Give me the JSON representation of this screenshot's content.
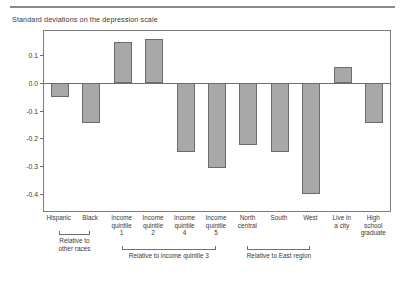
{
  "chart_data": {
    "type": "bar",
    "title": "Standard deviations on the depression scale",
    "xlabel": "",
    "ylabel": "",
    "ylim": [
      -0.46,
      0.185
    ],
    "grid": false,
    "legend": null,
    "yticks": [
      0.1,
      0.0,
      -0.1,
      -0.2,
      -0.3,
      -0.4
    ],
    "ytick_labels": [
      "0.1",
      "0.0",
      "-0.1",
      "-0.2",
      "-0.3",
      "-0.4"
    ],
    "categories": [
      "Hispanic",
      "Black",
      "Income quintile 1",
      "Income quintile 2",
      "Income quintile 4",
      "Income quintile 5",
      "North central",
      "South",
      "West",
      "Live in a city",
      "High school graduate"
    ],
    "category_lines": [
      [
        "Hispanic"
      ],
      [
        "Black"
      ],
      [
        "Income",
        "quintile",
        "1"
      ],
      [
        "Income",
        "quintile",
        "2"
      ],
      [
        "Income",
        "quintile",
        "4"
      ],
      [
        "Income",
        "quintile",
        "5"
      ],
      [
        "North",
        "central"
      ],
      [
        "South"
      ],
      [
        "West"
      ],
      [
        "Live in",
        "a city"
      ],
      [
        "High",
        "school",
        "graduate"
      ]
    ],
    "values": [
      -0.05,
      -0.145,
      0.145,
      0.155,
      -0.25,
      -0.305,
      -0.225,
      -0.25,
      -0.4,
      0.055,
      -0.145
    ],
    "bar_color": "#a8a8a8",
    "bar_edge_color": "#6b6b6b",
    "groups": [
      {
        "label": "Relative to other races",
        "first": 0,
        "last": 1
      },
      {
        "label": "Relative to income quintile 3",
        "first": 2,
        "last": 5
      },
      {
        "label": "Relative to East region",
        "first": 6,
        "last": 8
      }
    ]
  }
}
